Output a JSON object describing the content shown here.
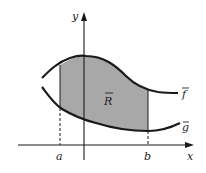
{
  "diagram": {
    "type": "region-between-curves",
    "region_label": "R",
    "upper_curve_label": "f",
    "lower_curve_label": "g",
    "x_axis_label": "x",
    "y_axis_label": "y",
    "left_bound_label": "a",
    "right_bound_label": "b",
    "colors": {
      "region_fill": "#a8a8a8",
      "stroke": "#1a1a1a",
      "background": "#ffffff"
    }
  }
}
